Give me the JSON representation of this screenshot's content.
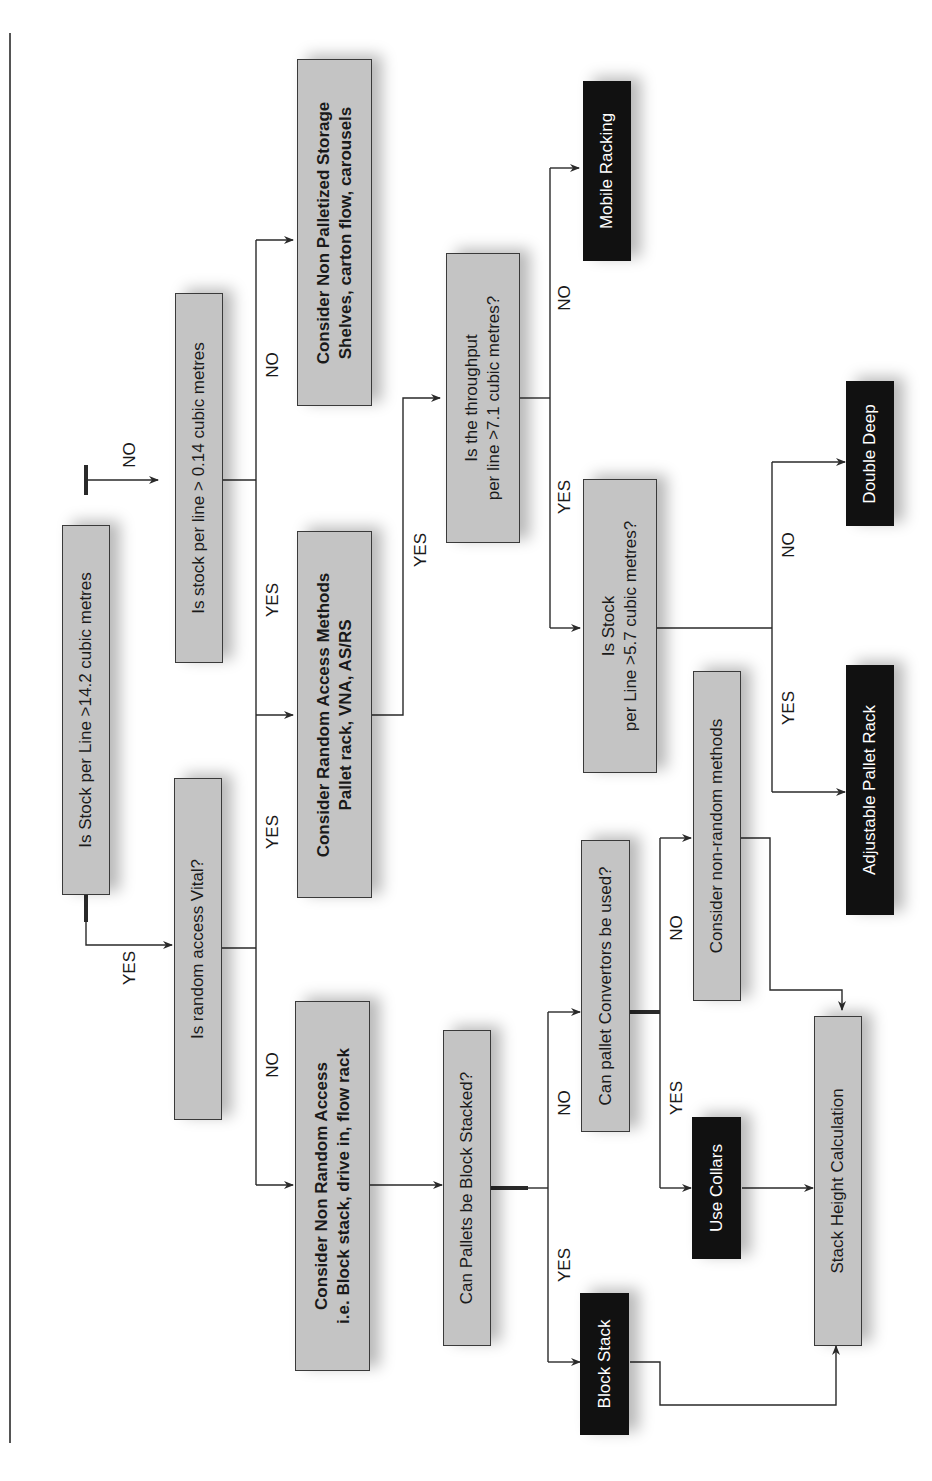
{
  "diagram": {
    "orientation": "rotated -90deg (reads bottom to top)",
    "colors": {
      "decision_fill": "#c4c4c4",
      "terminal_fill": "#111111",
      "terminal_text": "#ffffff",
      "line": "#2a2a2a"
    },
    "nodes": {
      "q_stock_14": {
        "lines": [
          "Is Stock per Line >14.2 cubic metres"
        ],
        "type": "decision"
      },
      "q_stock_014": {
        "lines": [
          "Is stock per line > 0.14 cubic metres"
        ],
        "type": "decision"
      },
      "q_random_vital": {
        "lines": [
          "Is random access Vital?"
        ],
        "type": "decision"
      },
      "non_palletized": {
        "lines": [
          "Consider Non Palletized Storage",
          "Shelves, carton flow, carousels"
        ],
        "type": "process"
      },
      "random_access": {
        "lines": [
          "Consider Random Access Methods",
          "Pallet rack, VNA, AS/RS"
        ],
        "type": "process"
      },
      "non_random_access": {
        "lines": [
          "Consider Non Random Access",
          "i.e. Block stack, drive in, flow rack"
        ],
        "type": "process"
      },
      "q_throughput": {
        "lines": [
          "Is the throughput",
          "per line >7.1 cubic metres?"
        ],
        "type": "decision"
      },
      "mobile_racking": {
        "lines": [
          "Mobile Racking"
        ],
        "type": "terminal"
      },
      "q_stock_57": {
        "lines": [
          "Is Stock",
          "per Line >5.7 cubic metres?"
        ],
        "type": "decision"
      },
      "double_deep": {
        "lines": [
          "Double Deep"
        ],
        "type": "terminal"
      },
      "adjustable_pallet_rack": {
        "lines": [
          "Adjustable Pallet Rack"
        ],
        "type": "terminal"
      },
      "q_block_stacked": {
        "lines": [
          "Can Pallets be Block Stacked?"
        ],
        "type": "decision"
      },
      "q_convertors": {
        "lines": [
          "Can pallet Convertors be used?"
        ],
        "type": "decision"
      },
      "consider_non_random": {
        "lines": [
          "Consider non-random methods"
        ],
        "type": "decision"
      },
      "block_stack": {
        "lines": [
          "Block Stack"
        ],
        "type": "terminal"
      },
      "use_collars": {
        "lines": [
          "Use Collars"
        ],
        "type": "terminal"
      },
      "stack_height": {
        "lines": [
          "Stack Height Calculation"
        ],
        "type": "decision"
      }
    },
    "edge_labels": {
      "yes": "YES",
      "no": "NO"
    },
    "edges": [
      {
        "from": "q_stock_14",
        "to": "q_random_vital",
        "label": "YES"
      },
      {
        "from": "q_stock_14",
        "to": "q_stock_014",
        "label": "NO"
      },
      {
        "from": "q_stock_014",
        "to": "random_access",
        "label": "YES"
      },
      {
        "from": "q_stock_014",
        "to": "non_palletized",
        "label": "NO"
      },
      {
        "from": "q_random_vital",
        "to": "random_access",
        "label": "YES"
      },
      {
        "from": "q_random_vital",
        "to": "non_random_access",
        "label": "NO"
      },
      {
        "from": "random_access",
        "to": "q_throughput",
        "label": "YES"
      },
      {
        "from": "q_throughput",
        "to": "q_stock_57",
        "label": "YES"
      },
      {
        "from": "q_throughput",
        "to": "mobile_racking",
        "label": "NO"
      },
      {
        "from": "q_stock_57",
        "to": "adjustable_pallet_rack",
        "label": "YES"
      },
      {
        "from": "q_stock_57",
        "to": "double_deep",
        "label": "NO"
      },
      {
        "from": "non_random_access",
        "to": "q_block_stacked",
        "label": ""
      },
      {
        "from": "q_block_stacked",
        "to": "block_stack",
        "label": "YES"
      },
      {
        "from": "q_block_stacked",
        "to": "q_convertors",
        "label": "NO"
      },
      {
        "from": "q_convertors",
        "to": "use_collars",
        "label": "YES"
      },
      {
        "from": "q_convertors",
        "to": "consider_non_random",
        "label": "NO"
      },
      {
        "from": "block_stack",
        "to": "stack_height",
        "label": ""
      },
      {
        "from": "use_collars",
        "to": "stack_height",
        "label": ""
      },
      {
        "from": "consider_non_random",
        "to": "stack_height",
        "label": ""
      }
    ]
  }
}
